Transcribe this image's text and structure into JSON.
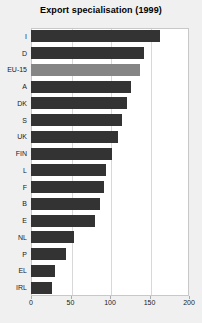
{
  "chart_data": {
    "type": "bar",
    "orientation": "horizontal",
    "title": "Export specialisation (1999)",
    "xlabel": "",
    "ylabel": "",
    "xlim": [
      0,
      200
    ],
    "xticks": [
      0,
      50,
      100,
      150,
      200
    ],
    "grid": true,
    "legend": null,
    "highlight_category": "EU-15",
    "colors": {
      "bar": "#333333",
      "highlight_bar": "#858585",
      "plot_background": "#ffffff",
      "page_background": "#f0f0f0",
      "gridline": "#d8d8d8",
      "text": "#1a1a1a"
    },
    "categories": [
      "I",
      "D",
      "EU-15",
      "A",
      "DK",
      "S",
      "UK",
      "FIN",
      "L",
      "F",
      "B",
      "E",
      "NL",
      "P",
      "EL",
      "IRL"
    ],
    "values": [
      163,
      143,
      138,
      127,
      122,
      115,
      110,
      103,
      95,
      92,
      87,
      81,
      54,
      44,
      30,
      27
    ]
  }
}
